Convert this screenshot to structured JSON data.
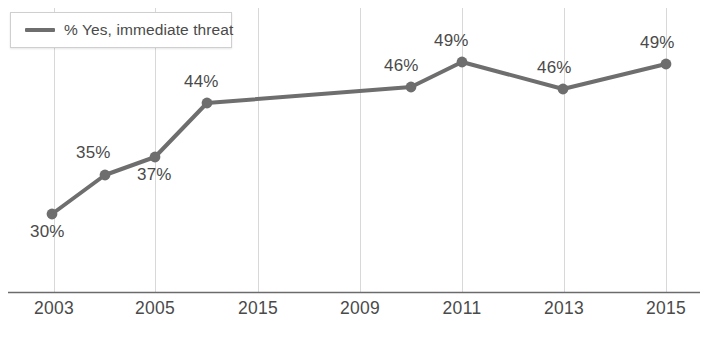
{
  "chart_data": {
    "type": "line",
    "title": "",
    "xlabel": "",
    "ylabel": "",
    "grid": "vertical",
    "legend_position": "top-left",
    "legend": [
      "% Yes, immediate threat"
    ],
    "series": [
      {
        "name": "% Yes, immediate threat",
        "color": "#6e6e6e",
        "values": [
          30,
          35,
          37,
          44,
          46,
          49,
          46,
          49
        ]
      }
    ],
    "categories": [
      "2003",
      "2004",
      "2005",
      "2006",
      "2010",
      "2011",
      "2013",
      "2015"
    ],
    "points": [
      {
        "label": "30%",
        "value": 30,
        "x": 52,
        "y": 214,
        "label_x": 30,
        "label_y": 222
      },
      {
        "label": "35%",
        "value": 35,
        "x": 105,
        "y": 175,
        "label_x": 76,
        "label_y": 143
      },
      {
        "label": "37%",
        "value": 37,
        "x": 155,
        "y": 157,
        "label_x": 137,
        "label_y": 165
      },
      {
        "label": "44%",
        "value": 44,
        "x": 207,
        "y": 103,
        "label_x": 184,
        "label_y": 72
      },
      {
        "label": "46%",
        "value": 46,
        "x": 411,
        "y": 87,
        "label_x": 384,
        "label_y": 56
      },
      {
        "label": "49%",
        "value": 49,
        "x": 462,
        "y": 62,
        "label_x": 434,
        "label_y": 31
      },
      {
        "label": "46%",
        "value": 46,
        "x": 563,
        "y": 89,
        "label_x": 537,
        "label_y": 58
      },
      {
        "label": "49%",
        "value": 49,
        "x": 666,
        "y": 64,
        "label_x": 640,
        "label_y": 33
      }
    ],
    "xtick_labels": [
      "2003",
      "2005",
      "2015",
      "2009",
      "2011",
      "2013",
      "2015"
    ],
    "xtick_positions": [
      54,
      155,
      258,
      360,
      462,
      564,
      666
    ],
    "gridline_positions": [
      54,
      155,
      258,
      360,
      462,
      564,
      666
    ],
    "ylim": [
      24,
      56
    ],
    "axis_line_y": 292
  },
  "legend": {
    "label": "% Yes, immediate threat"
  },
  "source_artifact": ""
}
